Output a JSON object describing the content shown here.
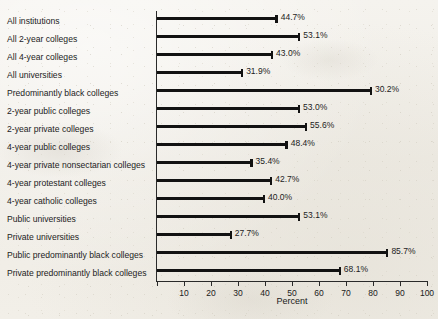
{
  "chart_data": {
    "type": "bar",
    "orientation": "horizontal",
    "title": "",
    "xlabel": "Percent",
    "ylabel": "",
    "xlim": [
      0,
      100
    ],
    "xticks": [
      0,
      10,
      20,
      30,
      40,
      50,
      60,
      70,
      80,
      90,
      100
    ],
    "xticklabels": [
      "",
      "10",
      "20",
      "30",
      "40",
      "50",
      "60",
      "70",
      "80",
      "90",
      "100"
    ],
    "grid": false,
    "legend": null,
    "bar_color": "#121212",
    "background_color": "#f1eee7",
    "categories": [
      "All institutions",
      "All 2-year colleges",
      "All 4-year colleges",
      "All universities",
      "Predominantly black colleges",
      "2-year public colleges",
      "2-year private colleges",
      "4-year public colleges",
      "4-year private nonsectarian colleges",
      "4-year protestant colleges",
      "4-year catholic colleges",
      "Public universities",
      "Private universities",
      "Public predominantly black colleges",
      "Private predominantly black colleges"
    ],
    "values": [
      44.7,
      53.1,
      43.0,
      31.9,
      30.2,
      53.0,
      55.6,
      48.4,
      35.4,
      42.7,
      40.0,
      53.1,
      27.7,
      85.7,
      68.1
    ],
    "value_labels": [
      "44.7%",
      "53.1%",
      "43.0%",
      "31.9%",
      "30.2%",
      "53.0%",
      "55.6%",
      "48.4%",
      "35.4%",
      "42.7%",
      "40.0%",
      "53.1%",
      "27.7%",
      "85.7%",
      "68.1%"
    ],
    "bar_lengths_percent": [
      44.7,
      53.1,
      43.0,
      31.9,
      79.6,
      53.0,
      55.6,
      48.4,
      35.4,
      42.7,
      40.0,
      53.1,
      27.7,
      85.7,
      68.1
    ]
  },
  "rows": [
    {
      "label": "All institutions",
      "value_label": "44.7%",
      "bar": 44.7
    },
    {
      "label": "All 2-year colleges",
      "value_label": "53.1%",
      "bar": 53.1
    },
    {
      "label": "All 4-year colleges",
      "value_label": "43.0%",
      "bar": 43.0
    },
    {
      "label": "All universities",
      "value_label": "31.9%",
      "bar": 31.9
    },
    {
      "label": "Predominantly black colleges",
      "value_label": "30.2%",
      "bar": 79.6
    },
    {
      "label": "2-year public colleges",
      "value_label": "53.0%",
      "bar": 53.0
    },
    {
      "label": "2-year private colleges",
      "value_label": "55.6%",
      "bar": 55.6
    },
    {
      "label": "4-year public colleges",
      "value_label": "48.4%",
      "bar": 48.4
    },
    {
      "label": "4-year private nonsectarian colleges",
      "value_label": "35.4%",
      "bar": 35.4
    },
    {
      "label": "4-year protestant colleges",
      "value_label": "42.7%",
      "bar": 42.7
    },
    {
      "label": "4-year catholic colleges",
      "value_label": "40.0%",
      "bar": 40.0
    },
    {
      "label": "Public universities",
      "value_label": "53.1%",
      "bar": 53.1
    },
    {
      "label": "Private universities",
      "value_label": "27.7%",
      "bar": 27.7
    },
    {
      "label": "Public predominantly black colleges",
      "value_label": "85.7%",
      "bar": 85.7
    },
    {
      "label": "Private predominantly black colleges",
      "value_label": "68.1%",
      "bar": 68.1
    }
  ],
  "axis": {
    "x_title": "Percent",
    "ticks": [
      "",
      "10",
      "20",
      "30",
      "40",
      "50",
      "60",
      "70",
      "80",
      "90",
      "100"
    ]
  }
}
